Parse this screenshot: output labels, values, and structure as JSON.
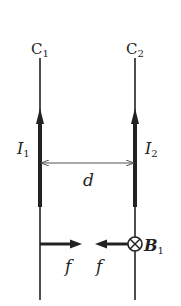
{
  "diagram": {
    "wires": [
      {
        "label": "C",
        "subscript": "1",
        "current_label": "I",
        "current_subscript": "1",
        "current_direction": "up"
      },
      {
        "label": "C",
        "subscript": "2",
        "current_label": "I",
        "current_subscript": "2",
        "current_direction": "up"
      }
    ],
    "separation_label": "d",
    "forces": [
      {
        "label": "f",
        "direction": "right",
        "on_wire": "C1"
      },
      {
        "label": "f",
        "direction": "left",
        "on_wire": "C2"
      }
    ],
    "field": {
      "label": "B",
      "subscript": "1",
      "symbol": "into-page",
      "glyph": "⊗"
    },
    "colors": {
      "ink": "#222222",
      "background": "#ffffff",
      "dim_line": "#555555"
    }
  }
}
